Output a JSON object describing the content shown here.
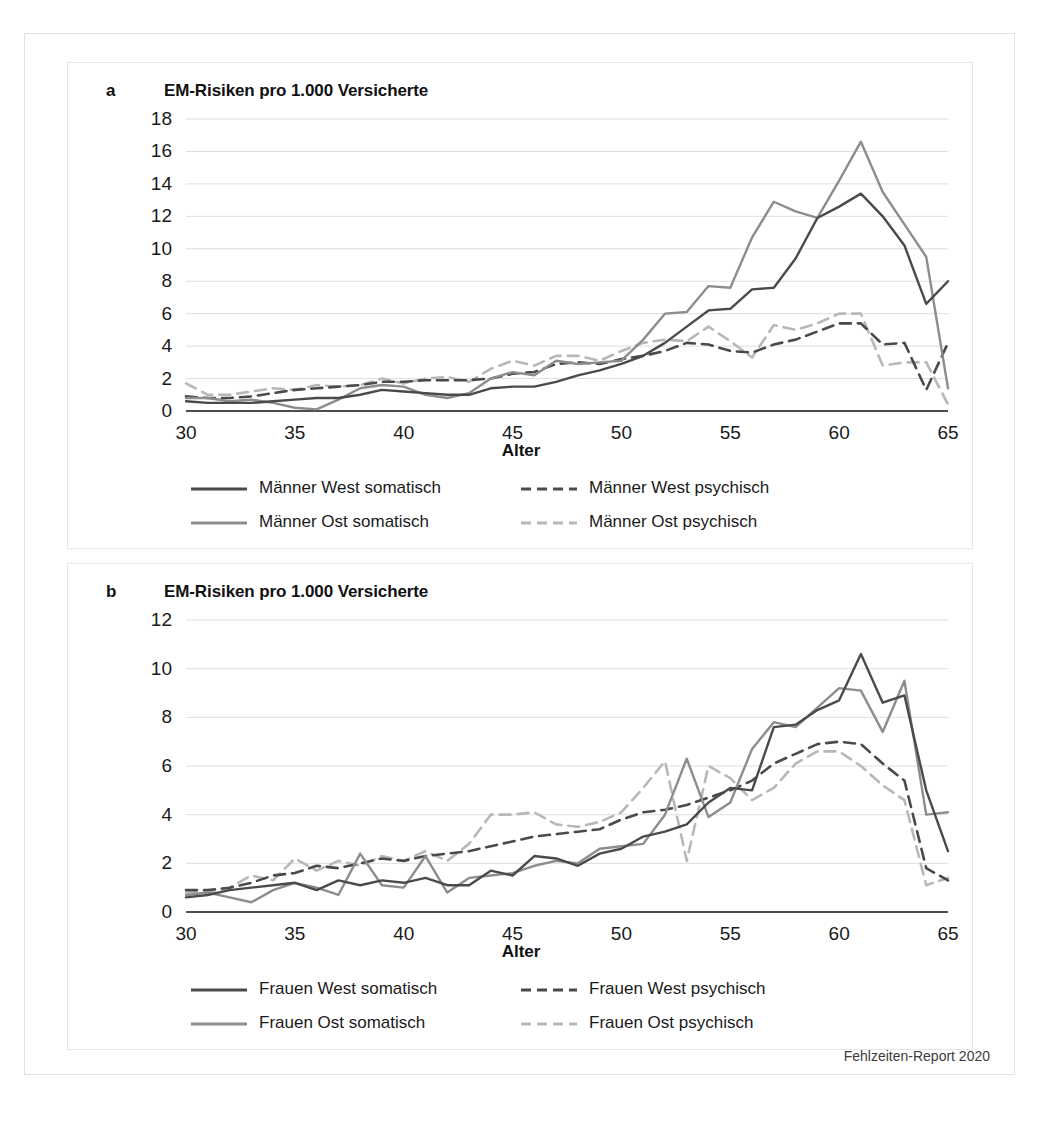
{
  "figure": {
    "source_note": "Fehlzeiten-Report 2020"
  },
  "panel_a": {
    "letter": "a",
    "title": "EM-Risiken pro 1.000 Versicherte",
    "axis_title": "Alter",
    "legend": [
      {
        "label": "Männer West somatisch",
        "style": "solid",
        "color": "#4a4a4a"
      },
      {
        "label": "Männer West psychisch",
        "style": "dashed",
        "color": "#4a4a4a"
      },
      {
        "label": "Männer Ost somatisch",
        "style": "solid",
        "color": "#8d8d8d"
      },
      {
        "label": "Männer Ost psychisch",
        "style": "dashed",
        "color": "#b8b8b8"
      }
    ]
  },
  "panel_b": {
    "letter": "b",
    "title": "EM-Risiken pro 1.000 Versicherte",
    "axis_title": "Alter",
    "legend": [
      {
        "label": "Frauen West somatisch",
        "style": "solid",
        "color": "#4a4a4a"
      },
      {
        "label": "Frauen West psychisch",
        "style": "dashed",
        "color": "#4a4a4a"
      },
      {
        "label": "Frauen Ost somatisch",
        "style": "solid",
        "color": "#8d8d8d"
      },
      {
        "label": "Frauen Ost psychisch",
        "style": "dashed",
        "color": "#b8b8b8"
      }
    ]
  },
  "chart_data": [
    {
      "id": "chart-a",
      "type": "line",
      "title": "EM-Risiken pro 1.000 Versicherte",
      "panel_letter": "a",
      "xlabel": "Alter",
      "ylabel": "",
      "xlim": [
        30,
        65
      ],
      "ylim": [
        0,
        18
      ],
      "xticks": [
        30,
        35,
        40,
        45,
        50,
        55,
        60,
        65
      ],
      "yticks": [
        0,
        2,
        4,
        6,
        8,
        10,
        12,
        14,
        16,
        18
      ],
      "grid": true,
      "legend_position": "bottom",
      "x": [
        30,
        31,
        32,
        33,
        34,
        35,
        36,
        37,
        38,
        39,
        40,
        41,
        42,
        43,
        44,
        45,
        46,
        47,
        48,
        49,
        50,
        51,
        52,
        53,
        54,
        55,
        56,
        57,
        58,
        59,
        60,
        61,
        62,
        63,
        64,
        65
      ],
      "series": [
        {
          "name": "Männer West somatisch",
          "color": "#4a4a4a",
          "style": "solid",
          "values": [
            0.6,
            0.5,
            0.5,
            0.5,
            0.6,
            0.7,
            0.8,
            0.8,
            1.0,
            1.3,
            1.2,
            1.1,
            1.0,
            1.0,
            1.4,
            1.5,
            1.5,
            1.8,
            2.2,
            2.5,
            2.9,
            3.4,
            4.2,
            5.2,
            6.2,
            6.3,
            7.5,
            7.6,
            9.4,
            11.9,
            12.6,
            13.4,
            12.0,
            10.2,
            6.6,
            8.0
          ]
        },
        {
          "name": "Männer West psychisch",
          "color": "#4a4a4a",
          "style": "dashed",
          "values": [
            0.9,
            0.8,
            0.8,
            0.9,
            1.1,
            1.3,
            1.4,
            1.5,
            1.6,
            1.8,
            1.8,
            1.9,
            1.9,
            1.9,
            2.0,
            2.3,
            2.4,
            2.9,
            3.0,
            2.9,
            3.2,
            3.4,
            3.7,
            4.2,
            4.1,
            3.7,
            3.6,
            4.1,
            4.4,
            4.9,
            5.4,
            5.4,
            4.1,
            4.2,
            1.3,
            4.2
          ]
        },
        {
          "name": "Männer Ost somatisch",
          "color": "#8d8d8d",
          "style": "solid",
          "values": [
            0.8,
            0.8,
            0.6,
            0.7,
            0.5,
            0.2,
            0.1,
            0.7,
            1.4,
            1.6,
            1.5,
            1.0,
            0.8,
            1.1,
            2.0,
            2.4,
            2.2,
            3.1,
            2.9,
            3.0,
            3.1,
            4.4,
            6.0,
            6.1,
            7.7,
            7.6,
            10.7,
            12.9,
            12.3,
            11.9,
            14.2,
            16.6,
            13.5,
            11.5,
            9.5,
            1.4
          ]
        },
        {
          "name": "Männer Ost psychisch",
          "color": "#b8b8b8",
          "style": "dashed",
          "values": [
            1.7,
            1.0,
            1.0,
            1.2,
            1.4,
            1.3,
            1.6,
            1.5,
            1.6,
            2.0,
            1.7,
            2.0,
            2.1,
            1.8,
            2.6,
            3.1,
            2.8,
            3.4,
            3.4,
            3.1,
            3.7,
            4.2,
            4.4,
            4.3,
            5.2,
            4.3,
            3.3,
            5.3,
            5.0,
            5.4,
            6.0,
            6.0,
            2.8,
            3.0,
            3.0,
            0.4
          ]
        }
      ]
    },
    {
      "id": "chart-b",
      "type": "line",
      "title": "EM-Risiken pro 1.000 Versicherte",
      "panel_letter": "b",
      "xlabel": "Alter",
      "ylabel": "",
      "xlim": [
        30,
        65
      ],
      "ylim": [
        0,
        12
      ],
      "xticks": [
        30,
        35,
        40,
        45,
        50,
        55,
        60,
        65
      ],
      "yticks": [
        0,
        2,
        4,
        6,
        8,
        10,
        12
      ],
      "grid": true,
      "legend_position": "bottom",
      "x": [
        30,
        31,
        32,
        33,
        34,
        35,
        36,
        37,
        38,
        39,
        40,
        41,
        42,
        43,
        44,
        45,
        46,
        47,
        48,
        49,
        50,
        51,
        52,
        53,
        54,
        55,
        56,
        57,
        58,
        59,
        60,
        61,
        62,
        63,
        64,
        65
      ],
      "series": [
        {
          "name": "Frauen West somatisch",
          "color": "#4a4a4a",
          "style": "solid",
          "values": [
            0.6,
            0.7,
            0.9,
            1.0,
            1.1,
            1.2,
            0.9,
            1.3,
            1.1,
            1.3,
            1.2,
            1.4,
            1.1,
            1.1,
            1.7,
            1.5,
            2.3,
            2.2,
            1.9,
            2.4,
            2.6,
            3.1,
            3.3,
            3.6,
            4.5,
            5.1,
            5.0,
            7.6,
            7.7,
            8.3,
            8.7,
            10.6,
            8.6,
            8.9,
            5.0,
            2.5
          ]
        },
        {
          "name": "Frauen West psychisch",
          "color": "#4a4a4a",
          "style": "dashed",
          "values": [
            0.9,
            0.9,
            1.0,
            1.2,
            1.5,
            1.6,
            1.9,
            1.8,
            2.0,
            2.2,
            2.1,
            2.3,
            2.4,
            2.5,
            2.7,
            2.9,
            3.1,
            3.2,
            3.3,
            3.4,
            3.8,
            4.1,
            4.2,
            4.4,
            4.7,
            5.0,
            5.4,
            6.1,
            6.5,
            6.9,
            7.0,
            6.9,
            6.1,
            5.4,
            1.8,
            1.3
          ]
        },
        {
          "name": "Frauen Ost somatisch",
          "color": "#8d8d8d",
          "style": "solid",
          "values": [
            0.7,
            0.8,
            0.6,
            0.4,
            0.9,
            1.2,
            1.0,
            0.7,
            2.4,
            1.1,
            1.0,
            2.3,
            0.8,
            1.4,
            1.5,
            1.6,
            1.9,
            2.1,
            2.0,
            2.6,
            2.7,
            2.8,
            4.0,
            6.3,
            3.9,
            4.5,
            6.7,
            7.8,
            7.6,
            8.4,
            9.2,
            9.1,
            7.4,
            9.5,
            4.0,
            4.1
          ]
        },
        {
          "name": "Frauen Ost psychisch",
          "color": "#b8b8b8",
          "style": "dashed",
          "values": [
            0.8,
            0.8,
            1.0,
            1.5,
            1.3,
            2.2,
            1.7,
            2.1,
            1.9,
            2.3,
            2.1,
            2.5,
            2.1,
            2.8,
            4.0,
            4.0,
            4.1,
            3.6,
            3.5,
            3.7,
            4.1,
            5.1,
            6.2,
            2.1,
            6.0,
            5.5,
            4.6,
            5.1,
            6.1,
            6.6,
            6.6,
            6.0,
            5.2,
            4.6,
            1.1,
            1.4
          ]
        }
      ]
    }
  ]
}
